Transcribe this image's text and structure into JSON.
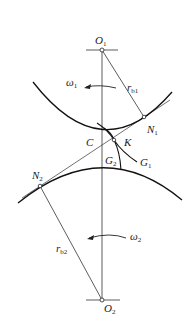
{
  "diagram": {
    "type": "gear meshing diagram (involute gear tooth contact along line of action)",
    "colors": {
      "stroke": "#222222",
      "background": "#ffffff"
    },
    "labels": {
      "O1": {
        "main": "O",
        "sub": "1"
      },
      "O2": {
        "main": "O",
        "sub": "2"
      },
      "omega1": {
        "main": "ω",
        "sub": "1"
      },
      "omega2": {
        "main": "ω",
        "sub": "2"
      },
      "rb1": {
        "main": "r",
        "sub": "b1"
      },
      "rb2": {
        "main": "r",
        "sub": "b2"
      },
      "N1": {
        "main": "N",
        "sub": "1"
      },
      "N2": {
        "main": "N",
        "sub": "2"
      },
      "C": {
        "main": "C",
        "sub": ""
      },
      "K": {
        "main": "K",
        "sub": ""
      },
      "G1": {
        "main": "G",
        "sub": "1"
      },
      "G2": {
        "main": "G",
        "sub": "2"
      }
    },
    "points": {
      "O1": [
        102,
        50
      ],
      "O2": [
        102,
        300
      ],
      "N1": [
        144,
        117
      ],
      "N2": [
        40,
        186
      ],
      "K": [
        114,
        140
      ]
    }
  }
}
